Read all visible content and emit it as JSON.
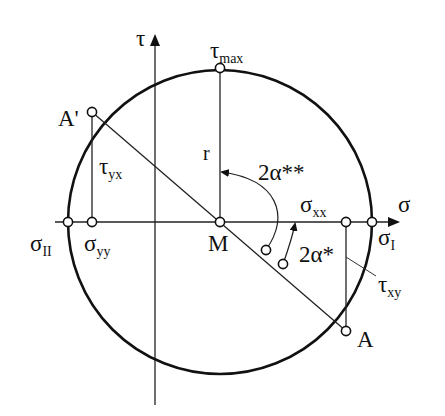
{
  "figure": {
    "type": "mohr-circle",
    "axes": {
      "horizontal_label": "σ",
      "vertical_label": "τ"
    },
    "labels": {
      "tau_max": {
        "main": "τ",
        "sub": "max"
      },
      "A_prime": "A'",
      "A": "A",
      "M": "M",
      "r": "r",
      "sigma_I": {
        "main": "σ",
        "sub": "I"
      },
      "sigma_II": {
        "main": "σ",
        "sub": "II"
      },
      "sigma_xx": {
        "main": "σ",
        "sub": "xx"
      },
      "sigma_yy": {
        "main": "σ",
        "sub": "yy"
      },
      "tau_yx": {
        "main": "τ",
        "sub": "yx"
      },
      "tau_xy": {
        "main": "τ",
        "sub": "xy"
      },
      "angle_2a_star": "2α*",
      "angle_2a_star_star": "2α**"
    }
  }
}
